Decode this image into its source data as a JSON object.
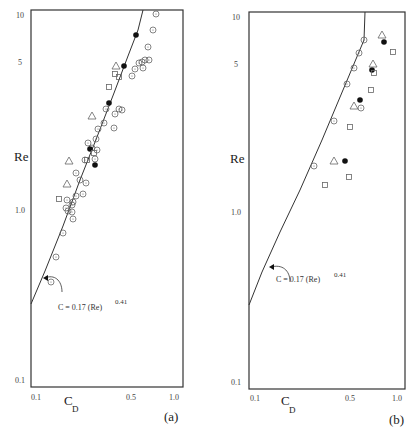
{
  "chart_data": [
    {
      "type": "scatter",
      "panel_label": "(a)",
      "xlabel": "C_D",
      "ylabel": "Re",
      "x_ticks": [
        "0.1",
        "0.5",
        "1.0"
      ],
      "y_ticks": [
        "10",
        "5",
        "1.0",
        "0.1"
      ],
      "annotation": "C = 0.17 (Re)^0.41",
      "fit_line": {
        "label": "C = 0.17 (Re)^0.41"
      },
      "note": "Point values are approximate, read by eye from marker positions. Tick spacing is uneven in the source image, so the axis scale is not strictly logarithmic.",
      "series": [
        {
          "name": "open circle (dotted)",
          "marker": "circle-dot",
          "points_px": [
            [
              156,
              14
            ],
            [
              153,
              30
            ],
            [
              148,
              47
            ],
            [
              149,
              60
            ],
            [
              145,
              60
            ],
            [
              142,
              62
            ],
            [
              143,
              68
            ],
            [
              139,
              63
            ],
            [
              135,
              69
            ],
            [
              132,
              76
            ],
            [
              119,
              109
            ],
            [
              122,
              110
            ],
            [
              115,
              114
            ],
            [
              106,
              109
            ],
            [
              104,
              123
            ],
            [
              114,
              128
            ],
            [
              98,
              129
            ],
            [
              96,
              139
            ],
            [
              88,
              143
            ],
            [
              92,
              148
            ],
            [
              97,
              150
            ],
            [
              95,
              159
            ],
            [
              85,
              160
            ],
            [
              76,
              173
            ],
            [
              80,
              180
            ],
            [
              86,
              183
            ],
            [
              76,
              196
            ],
            [
              73,
              202
            ],
            [
              67,
              200
            ],
            [
              72,
              205
            ],
            [
              83,
              194
            ],
            [
              68,
              211
            ],
            [
              72,
              212
            ],
            [
              66,
              208
            ],
            [
              63,
              233
            ],
            [
              56,
              257
            ],
            [
              51,
              282
            ],
            [
              73,
              219
            ]
          ]
        },
        {
          "name": "filled circle",
          "marker": "filled-circle",
          "points_px": [
            [
              136,
              35
            ],
            [
              124,
              66
            ],
            [
              109,
              103
            ],
            [
              90,
              149
            ],
            [
              95,
              165
            ]
          ]
        },
        {
          "name": "open triangle",
          "marker": "triangle",
          "points_px": [
            [
              116,
              66
            ],
            [
              92,
              116
            ],
            [
              69,
              161
            ],
            [
              67,
              184
            ]
          ]
        },
        {
          "name": "open square",
          "marker": "square",
          "points_px": [
            [
              115,
              74
            ],
            [
              119,
              77
            ],
            [
              109,
              87
            ],
            [
              94,
              153
            ],
            [
              87,
              160
            ],
            [
              59,
              199
            ]
          ]
        }
      ]
    },
    {
      "type": "scatter",
      "panel_label": "(b)",
      "xlabel": "C_D",
      "ylabel": "Re",
      "x_ticks": [
        "0.1",
        "0.5",
        "1.0"
      ],
      "y_ticks": [
        "10",
        "5",
        "1.0",
        "0.1"
      ],
      "annotation": "C = 0.17 (Re)^0.41",
      "fit_line": {
        "label": "C = 0.17 (Re)^0.41"
      },
      "note": "Point values are approximate, read by eye from marker positions.",
      "series": [
        {
          "name": "open circle (dotted)",
          "marker": "circle-dot",
          "points_px": [
            [
              364,
              40
            ],
            [
              359,
              53
            ],
            [
              354,
              68
            ],
            [
              347,
              84
            ],
            [
              334,
              121
            ],
            [
              314,
              166
            ],
            [
              361,
              108
            ]
          ]
        },
        {
          "name": "filled circle",
          "marker": "filled-circle",
          "points_px": [
            [
              384,
              42
            ],
            [
              372,
              70
            ],
            [
              360,
              100
            ],
            [
              345,
              161
            ]
          ]
        },
        {
          "name": "open triangle",
          "marker": "triangle",
          "points_px": [
            [
              382,
              35
            ],
            [
              373,
              64
            ],
            [
              354,
              106
            ],
            [
              334,
              161
            ]
          ]
        },
        {
          "name": "open square",
          "marker": "square",
          "points_px": [
            [
              393,
              52
            ],
            [
              374,
              73
            ],
            [
              371,
              90
            ],
            [
              350,
              127
            ],
            [
              349,
              177
            ],
            [
              325,
              185
            ]
          ]
        }
      ]
    }
  ],
  "panels": {
    "a": {
      "label": "(a)",
      "ylabel": "Re",
      "xlabel_main": "C",
      "xlabel_sub": "D",
      "annotation_main": "C   = 0.17 (Re)",
      "annotation_exp": "0.41",
      "yticks": [
        "10",
        "5",
        "1.0",
        "0.1"
      ],
      "xticks": [
        "0.1",
        "0.5",
        "1.0"
      ]
    },
    "b": {
      "label": "(b)",
      "ylabel": "Re",
      "xlabel_main": "C",
      "xlabel_sub": "D",
      "annotation_main": "C   = 0.17 (Re)",
      "annotation_exp": "0.41",
      "yticks": [
        "10",
        "5",
        "1.0",
        "0.1"
      ],
      "xticks": [
        "0.1",
        "0.5",
        "1.0"
      ]
    }
  }
}
